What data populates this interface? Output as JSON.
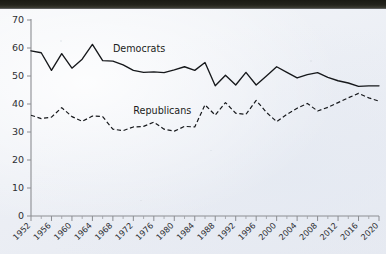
{
  "chart_data": {
    "type": "line",
    "title": "",
    "xlabel": "",
    "ylabel": "",
    "ylim": [
      0,
      70
    ],
    "xlim": [
      1952,
      2020
    ],
    "grid": false,
    "legend_position": "inline-annotation",
    "y_ticks": [
      0,
      10,
      20,
      30,
      40,
      50,
      60,
      70
    ],
    "x_ticks": [
      1952,
      1956,
      1960,
      1964,
      1968,
      1972,
      1976,
      1980,
      1984,
      1988,
      1992,
      1996,
      2000,
      2004,
      2008,
      2012,
      2016,
      2020
    ],
    "x": [
      1952,
      1954,
      1956,
      1958,
      1960,
      1962,
      1964,
      1966,
      1968,
      1970,
      1972,
      1974,
      1976,
      1978,
      1980,
      1982,
      1984,
      1986,
      1988,
      1990,
      1992,
      1994,
      1996,
      1998,
      2000,
      2002,
      2004,
      2006,
      2008,
      2010,
      2012,
      2014,
      2016,
      2018,
      2020
    ],
    "series": [
      {
        "name": "Democrats",
        "style": "solid",
        "color": "#16181b",
        "values": [
          59.0,
          58.3,
          52.0,
          58.0,
          52.8,
          56.0,
          61.3,
          55.5,
          55.3,
          54.0,
          52.0,
          51.3,
          51.5,
          51.2,
          52.2,
          53.3,
          52.0,
          54.8,
          46.5,
          50.3,
          46.8,
          51.3,
          46.8,
          50.0,
          53.3,
          51.3,
          49.3,
          50.5,
          51.2,
          49.5,
          48.3,
          47.5,
          46.3,
          46.5,
          46.5
        ]
      },
      {
        "name": "Republicans",
        "style": "dashed",
        "color": "#16181b",
        "values": [
          36.0,
          34.8,
          35.3,
          38.7,
          35.5,
          33.8,
          35.7,
          35.5,
          31.0,
          30.5,
          31.8,
          32.0,
          33.5,
          31.0,
          30.3,
          32.0,
          31.8,
          39.7,
          36.0,
          40.5,
          36.7,
          36.3,
          41.3,
          37.0,
          33.7,
          36.3,
          38.5,
          40.2,
          37.5,
          38.8,
          40.5,
          42.2,
          43.8,
          42.2,
          41.0
        ]
      }
    ],
    "annotations": [
      {
        "text": "Democrats",
        "x": 1968,
        "y": 58.5
      },
      {
        "text": "Republicans",
        "x": 1972,
        "y": 36.5
      }
    ]
  },
  "axes": {
    "y_tick_labels": [
      "70",
      "60",
      "50",
      "40",
      "30",
      "20",
      "10",
      "0"
    ],
    "x_tick_labels": [
      "1952",
      "1956",
      "1960",
      "1964",
      "1968",
      "1972",
      "1976",
      "1980",
      "1984",
      "1988",
      "1992",
      "1996",
      "2000",
      "2004",
      "2008",
      "2012",
      "2016",
      "2020"
    ]
  },
  "style": {
    "axis_color": "#8b8d92",
    "line_color": "#16181b",
    "text_color": "#2d2f33",
    "paper_color": "#eef0f4"
  }
}
